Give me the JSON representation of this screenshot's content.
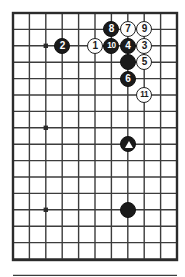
{
  "diagram": {
    "kind": "go-board-diagram",
    "board": {
      "columns": 11,
      "rows": 16,
      "left_px": 13,
      "top_px": 13,
      "right_px": 177,
      "bottom_px": 260,
      "cell_px": 16.4,
      "grid_color": "#3c3c3c",
      "border_color": "#2b2b2b",
      "background_color": "#ffffff",
      "star_point_color": "#2b2b2b"
    },
    "star_points": [
      {
        "name": "star-point-upper-left",
        "col": 2,
        "row": 2
      },
      {
        "name": "star-point-middle-left",
        "col": 2,
        "row": 7
      },
      {
        "name": "star-point-lower-left",
        "col": 2,
        "row": 12
      }
    ],
    "colors": {
      "black_stone": "#1a1a1a",
      "white_stone": "#fdfdfd",
      "black_label": "#ffffff",
      "white_label": "#1a1a1a",
      "stone_outline": "#222222"
    },
    "stones": [
      {
        "name": "stone-white-1",
        "label": "1",
        "color": "white",
        "col": 5,
        "row": 2
      },
      {
        "name": "stone-black-2",
        "label": "2",
        "color": "black",
        "col": 3,
        "row": 2
      },
      {
        "name": "stone-white-3",
        "label": "3",
        "color": "white",
        "col": 8,
        "row": 2
      },
      {
        "name": "stone-black-4",
        "label": "4",
        "color": "black",
        "col": 7,
        "row": 2
      },
      {
        "name": "stone-white-5",
        "label": "5",
        "color": "white",
        "col": 8,
        "row": 3
      },
      {
        "name": "stone-black-6",
        "label": "6",
        "color": "black",
        "col": 7,
        "row": 4
      },
      {
        "name": "stone-white-7",
        "label": "7",
        "color": "white",
        "col": 7,
        "row": 1
      },
      {
        "name": "stone-black-8",
        "label": "8",
        "color": "black",
        "col": 6,
        "row": 1
      },
      {
        "name": "stone-white-9",
        "label": "9",
        "color": "white",
        "col": 8,
        "row": 1
      },
      {
        "name": "stone-black-10",
        "label": "10",
        "color": "black",
        "col": 6,
        "row": 2
      },
      {
        "name": "stone-white-11",
        "label": "11",
        "color": "white",
        "col": 8,
        "row": 5
      },
      {
        "name": "stone-black-unmarked-upper",
        "label": "",
        "color": "black",
        "col": 7,
        "row": 3
      },
      {
        "name": "stone-black-triangle-marked",
        "label": "",
        "color": "black",
        "col": 7,
        "row": 8,
        "marker": "triangle"
      },
      {
        "name": "stone-black-lower",
        "label": "",
        "color": "black",
        "col": 7,
        "row": 12
      }
    ]
  }
}
